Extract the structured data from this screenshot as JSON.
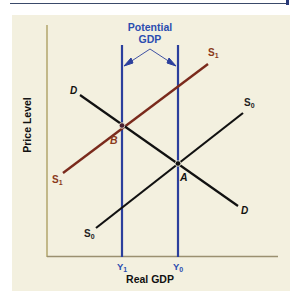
{
  "header": {
    "rule": "top-divider"
  },
  "diagram": {
    "title_annotation": [
      "Potential",
      "GDP"
    ],
    "axes": {
      "x_label": "Real GDP",
      "y_label": "Price Level"
    },
    "curves": {
      "demand": {
        "label_left": "D",
        "label_right": "D"
      },
      "supply_0": {
        "label": "S",
        "sub": "0"
      },
      "supply_1": {
        "label": "S",
        "sub": "1"
      }
    },
    "points": {
      "a": "A",
      "b": "B"
    },
    "x_ticks": {
      "y1": {
        "label": "Y",
        "sub": "1"
      },
      "y0": {
        "label": "Y",
        "sub": "0"
      }
    },
    "colors": {
      "background": "#f3f0df",
      "potential_gdp_lines": "#2b3f9c",
      "s1_curve": "#7a2a1c",
      "s0_d_curves": "#111111",
      "labels_blue": "#2b4db0",
      "labels_brown": "#8a3a1a"
    }
  }
}
